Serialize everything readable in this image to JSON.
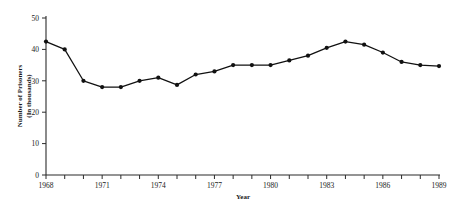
{
  "chart_data": {
    "type": "line",
    "title": "",
    "subtitle": "",
    "xlabel": "Year",
    "ylabel": "Number of Prisoners\n(In thousands)",
    "ylabel_line1": "Number of Prisoners",
    "ylabel_line2": "(In thousands)",
    "xlim": [
      1968,
      1989
    ],
    "ylim": [
      0,
      50
    ],
    "grid": false,
    "legend": "none",
    "y_ticks": [
      0,
      10,
      20,
      30,
      40,
      50
    ],
    "y_tick_labels": [
      "0",
      "10",
      "20",
      "30",
      "40",
      "50"
    ],
    "x_ticks": [
      1968,
      1969,
      1970,
      1971,
      1972,
      1973,
      1974,
      1975,
      1976,
      1977,
      1978,
      1979,
      1980,
      1981,
      1982,
      1983,
      1984,
      1985,
      1986,
      1987,
      1988,
      1989
    ],
    "x_tick_labels_shown": [
      "1968",
      "1971",
      "1974",
      "1977",
      "1980",
      "1983",
      "1986",
      "1989"
    ],
    "x": [
      1968,
      1969,
      1970,
      1971,
      1972,
      1973,
      1974,
      1975,
      1976,
      1977,
      1978,
      1979,
      1980,
      1981,
      1982,
      1983,
      1984,
      1985,
      1986,
      1987,
      1988,
      1989
    ],
    "values": [
      42.5,
      40.0,
      30.0,
      28.0,
      28.0,
      30.0,
      31.0,
      28.7,
      32.0,
      33.0,
      35.0,
      35.0,
      35.0,
      36.5,
      38.0,
      40.5,
      42.5,
      41.5,
      39.0,
      36.0,
      35.0,
      34.7
    ],
    "marker": "filled-circle",
    "line_color": "#111111",
    "marker_color": "#111111",
    "axis_color": "#2b2b2b"
  }
}
